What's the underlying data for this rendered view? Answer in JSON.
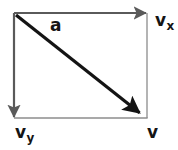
{
  "diagram": {
    "type": "vector-decomposition",
    "title": "",
    "background_color": "#ffffff",
    "canvas": {
      "width": 178,
      "height": 150
    },
    "colors": {
      "component_arrow": "#5a5a5a",
      "frame_line": "#8c8c8c",
      "resultant_arrow": "#141414",
      "label_text": "#141414"
    },
    "geometry": {
      "origin_x": 14,
      "origin_y": 13,
      "right_x": 147,
      "bottom_y": 118
    },
    "arrows": [
      {
        "name": "horizontal-component-arrow",
        "label_key": "vx",
        "from": [
          14,
          13
        ],
        "to": [
          152,
          13
        ],
        "direction": "right",
        "style": "component",
        "stroke_width": 2.2
      },
      {
        "name": "vertical-component-arrow",
        "label_key": "vy",
        "from": [
          14,
          13
        ],
        "to": [
          14,
          124
        ],
        "direction": "down",
        "style": "component",
        "stroke_width": 2.2
      },
      {
        "name": "resultant-vector-arrow",
        "label_key": "v",
        "from": [
          16,
          15
        ],
        "to": [
          146,
          118
        ],
        "direction": "down-right",
        "style": "resultant",
        "stroke_width": 3.2
      }
    ],
    "frame_lines": [
      {
        "name": "right-frame-line",
        "from": [
          147,
          13
        ],
        "to": [
          147,
          118
        ]
      },
      {
        "name": "bottom-frame-line",
        "from": [
          14,
          118
        ],
        "to": [
          147,
          118
        ]
      }
    ],
    "labels": {
      "a": {
        "base": "a",
        "sub": ""
      },
      "vx": {
        "base": "v",
        "sub": "x"
      },
      "vy": {
        "base": "v",
        "sub": "y"
      },
      "v": {
        "base": "v",
        "sub": ""
      }
    }
  }
}
